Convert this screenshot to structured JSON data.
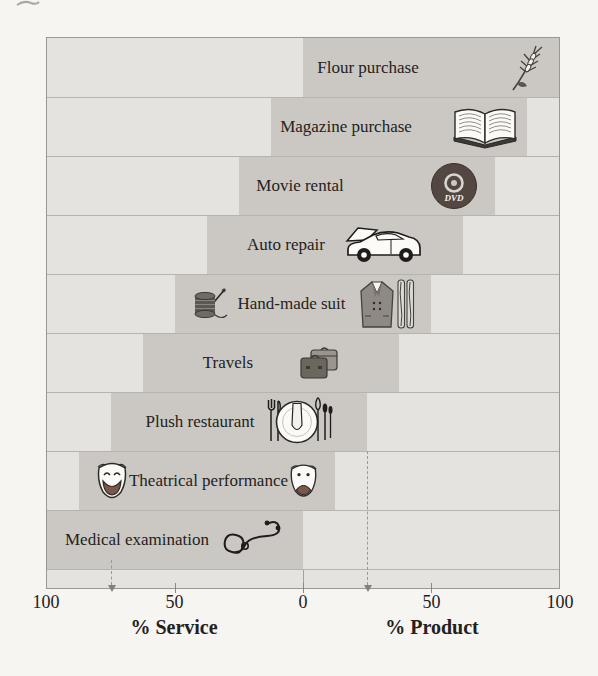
{
  "chart_data": {
    "type": "bar",
    "subtype": "diverging-range-continuum",
    "categories": [
      "Flour purchase",
      "Magazine purchase",
      "Movie rental",
      "Auto repair",
      "Hand-made suit",
      "Travels",
      "Plush restaurant",
      "Theatrical performance",
      "Medical examination"
    ],
    "ranges": [
      [
        0,
        100
      ],
      [
        -12.5,
        87.5
      ],
      [
        -25,
        75
      ],
      [
        -37.5,
        62.5
      ],
      [
        -50,
        50
      ],
      [
        -62.5,
        37.5
      ],
      [
        -75,
        25
      ],
      [
        -87.5,
        12.5
      ],
      [
        -100,
        0
      ]
    ],
    "xlim": [
      -100,
      100
    ],
    "ticks": [
      "100",
      "50",
      "0",
      "50",
      "100"
    ],
    "xlabel_left": "% Service",
    "xlabel_right": "% Product",
    "markers": [
      -75,
      25
    ],
    "icons": [
      "wheat-ear",
      "open-magazine",
      "dvd-disc",
      "car-open-hood",
      [
        "thread-spool",
        "suit-and-fabric"
      ],
      "suitcases",
      "plate-napkin-cutlery",
      [
        "comedy-mask",
        "comedy-mask"
      ],
      "stethoscope"
    ],
    "dvd_text": "DVD",
    "grid": false,
    "legend": false,
    "colors": {
      "page_bg": "#f6f5f1",
      "row_bg": "#e5e3df",
      "band": "#cbc8c3",
      "border": "#9a9894",
      "dvd_disc": "#544741",
      "mask_mouth": "#7d564c"
    }
  }
}
